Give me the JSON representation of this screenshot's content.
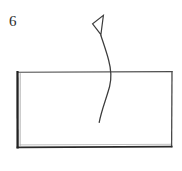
{
  "figure": {
    "label": "6",
    "background_color": "#ffffff",
    "ink_color": "#3a3a3a",
    "dark_ink_color": "#1a1a1a",
    "shapes": {
      "rectangle": {
        "name": "rectangle-outline",
        "x": 17,
        "y": 72,
        "width": 155,
        "height": 75,
        "stroke_width": 1,
        "heavy_edges": [
          "left",
          "bottom"
        ]
      },
      "curved_arrow": {
        "name": "curved-arrow",
        "description": "hand-drawn curved arrow rising from inside the rectangle, exiting through the top edge and pointing up-left",
        "tail_x": 99,
        "tail_y": 122,
        "tip_x": 102,
        "tip_y": 16,
        "direction": "up",
        "head_style": "open-triangle"
      }
    }
  }
}
